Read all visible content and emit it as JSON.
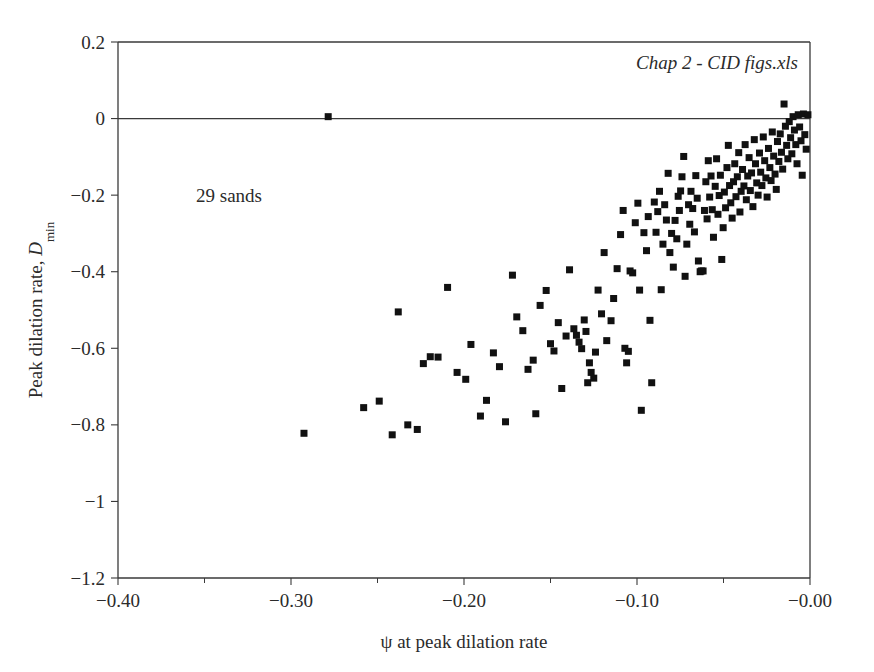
{
  "figure": {
    "background_color": "#ffffff",
    "axis_color": "#3a3a3a",
    "marker_color": "#111111",
    "annotations": {
      "sands_label": "29 sands",
      "source_label": "Chap 2 - CID figs.xls"
    }
  },
  "chart_data": {
    "type": "scatter",
    "title": "",
    "xlabel": "ψ at peak dilation rate",
    "ylabel_main": "Peak dilation rate, ",
    "ylabel_symbol": "D",
    "ylabel_subscript": "min",
    "xlim": [
      -0.4,
      0.0
    ],
    "ylim": [
      -1.2,
      0.2
    ],
    "xticks": [
      -0.4,
      -0.3,
      -0.2,
      -0.1,
      -0.0
    ],
    "xticklabels": [
      "−0.40",
      "−0.30",
      "−0.20",
      "−0.10",
      "−0.00"
    ],
    "yticks": [
      0.2,
      0,
      -0.2,
      -0.4,
      -0.6,
      -0.8,
      -1,
      -1.2
    ],
    "yticklabels": [
      "0.2",
      "0",
      "−0.2",
      "−0.4",
      "−0.6",
      "−0.8",
      "−1",
      "−1.2"
    ],
    "x_minor_ticks": [
      -0.35,
      -0.25,
      -0.15,
      -0.05
    ],
    "grid": false,
    "legend": null,
    "reference_lines": [
      {
        "axis": "y",
        "value": 0.0
      }
    ],
    "marker_style": "square",
    "marker_size_px": 7,
    "n_points": 177,
    "points": [
      [
        -0.2785,
        0.005
      ],
      [
        -0.2925,
        -0.822
      ],
      [
        -0.258,
        -0.755
      ],
      [
        -0.249,
        -0.738
      ],
      [
        -0.2415,
        -0.826
      ],
      [
        -0.238,
        -0.505
      ],
      [
        -0.2325,
        -0.8
      ],
      [
        -0.227,
        -0.812
      ],
      [
        -0.2235,
        -0.64
      ],
      [
        -0.2195,
        -0.622
      ],
      [
        -0.215,
        -0.623
      ],
      [
        -0.2095,
        -0.441
      ],
      [
        -0.204,
        -0.663
      ],
      [
        -0.199,
        -0.681
      ],
      [
        -0.196,
        -0.59
      ],
      [
        -0.1905,
        -0.777
      ],
      [
        -0.187,
        -0.736
      ],
      [
        -0.183,
        -0.612
      ],
      [
        -0.1795,
        -0.648
      ],
      [
        -0.176,
        -0.792
      ],
      [
        -0.172,
        -0.409
      ],
      [
        -0.1695,
        -0.518
      ],
      [
        -0.166,
        -0.554
      ],
      [
        -0.163,
        -0.655
      ],
      [
        -0.16,
        -0.631
      ],
      [
        -0.1585,
        -0.771
      ],
      [
        -0.156,
        -0.488
      ],
      [
        -0.1525,
        -0.449
      ],
      [
        -0.15,
        -0.588
      ],
      [
        -0.148,
        -0.607
      ],
      [
        -0.1455,
        -0.533
      ],
      [
        -0.1435,
        -0.705
      ],
      [
        -0.141,
        -0.568
      ],
      [
        -0.139,
        -0.395
      ],
      [
        -0.1365,
        -0.549
      ],
      [
        -0.135,
        -0.566
      ],
      [
        -0.1335,
        -0.584
      ],
      [
        -0.132,
        -0.601
      ],
      [
        -0.1305,
        -0.526
      ],
      [
        -0.1295,
        -0.556
      ],
      [
        -0.1285,
        -0.69
      ],
      [
        -0.1275,
        -0.638
      ],
      [
        -0.1265,
        -0.663
      ],
      [
        -0.125,
        -0.678
      ],
      [
        -0.124,
        -0.61
      ],
      [
        -0.1225,
        -0.448
      ],
      [
        -0.1205,
        -0.51
      ],
      [
        -0.119,
        -0.35
      ],
      [
        -0.1175,
        -0.58
      ],
      [
        -0.115,
        -0.528
      ],
      [
        -0.1135,
        -0.47
      ],
      [
        -0.1115,
        -0.392
      ],
      [
        -0.1095,
        -0.303
      ],
      [
        -0.108,
        -0.24
      ],
      [
        -0.107,
        -0.6
      ],
      [
        -0.106,
        -0.638
      ],
      [
        -0.105,
        -0.608
      ],
      [
        -0.104,
        -0.398
      ],
      [
        -0.1025,
        -0.403
      ],
      [
        -0.101,
        -0.272
      ],
      [
        -0.0995,
        -0.221
      ],
      [
        -0.0985,
        -0.448
      ],
      [
        -0.0975,
        -0.762
      ],
      [
        -0.096,
        -0.298
      ],
      [
        -0.0945,
        -0.345
      ],
      [
        -0.0935,
        -0.256
      ],
      [
        -0.0925,
        -0.527
      ],
      [
        -0.0915,
        -0.69
      ],
      [
        -0.09,
        -0.218
      ],
      [
        -0.089,
        -0.297
      ],
      [
        -0.088,
        -0.243
      ],
      [
        -0.087,
        -0.19
      ],
      [
        -0.086,
        -0.447
      ],
      [
        -0.085,
        -0.328
      ],
      [
        -0.084,
        -0.225
      ],
      [
        -0.083,
        -0.265
      ],
      [
        -0.082,
        -0.143
      ],
      [
        -0.081,
        -0.35
      ],
      [
        -0.08,
        -0.3
      ],
      [
        -0.079,
        -0.388
      ],
      [
        -0.078,
        -0.266
      ],
      [
        -0.077,
        -0.314
      ],
      [
        -0.0762,
        -0.203
      ],
      [
        -0.0755,
        -0.24
      ],
      [
        -0.0748,
        -0.189
      ],
      [
        -0.074,
        -0.152
      ],
      [
        -0.073,
        -0.099
      ],
      [
        -0.0722,
        -0.412
      ],
      [
        -0.0712,
        -0.328
      ],
      [
        -0.0702,
        -0.225
      ],
      [
        -0.0695,
        -0.276
      ],
      [
        -0.0688,
        -0.19
      ],
      [
        -0.0678,
        -0.235
      ],
      [
        -0.0668,
        -0.296
      ],
      [
        -0.066,
        -0.149
      ],
      [
        -0.0652,
        -0.208
      ],
      [
        -0.0645,
        -0.372
      ],
      [
        -0.0635,
        -0.4
      ],
      [
        -0.0628,
        -0.398
      ],
      [
        -0.0618,
        -0.398
      ],
      [
        -0.061,
        -0.24
      ],
      [
        -0.0602,
        -0.165
      ],
      [
        -0.0595,
        -0.262
      ],
      [
        -0.0588,
        -0.11
      ],
      [
        -0.058,
        -0.205
      ],
      [
        -0.0572,
        -0.15
      ],
      [
        -0.0565,
        -0.238
      ],
      [
        -0.0558,
        -0.31
      ],
      [
        -0.0548,
        -0.177
      ],
      [
        -0.054,
        -0.105
      ],
      [
        -0.0532,
        -0.25
      ],
      [
        -0.0525,
        -0.201
      ],
      [
        -0.0518,
        -0.148
      ],
      [
        -0.051,
        -0.368
      ],
      [
        -0.0502,
        -0.285
      ],
      [
        -0.0495,
        -0.192
      ],
      [
        -0.0488,
        -0.233
      ],
      [
        -0.048,
        -0.128
      ],
      [
        -0.0472,
        -0.07
      ],
      [
        -0.0465,
        -0.175
      ],
      [
        -0.0458,
        -0.22
      ],
      [
        -0.045,
        -0.26
      ],
      [
        -0.0442,
        -0.165
      ],
      [
        -0.0435,
        -0.118
      ],
      [
        -0.0428,
        -0.204
      ],
      [
        -0.042,
        -0.152
      ],
      [
        -0.0412,
        -0.089
      ],
      [
        -0.0405,
        -0.244
      ],
      [
        -0.0398,
        -0.19
      ],
      [
        -0.039,
        -0.133
      ],
      [
        -0.0382,
        -0.176
      ],
      [
        -0.0375,
        -0.068
      ],
      [
        -0.0368,
        -0.212
      ],
      [
        -0.036,
        -0.15
      ],
      [
        -0.0352,
        -0.102
      ],
      [
        -0.0345,
        -0.188
      ],
      [
        -0.0338,
        -0.142
      ],
      [
        -0.033,
        -0.23
      ],
      [
        -0.0322,
        -0.055
      ],
      [
        -0.0315,
        -0.118
      ],
      [
        -0.0308,
        -0.168
      ],
      [
        -0.03,
        -0.2
      ],
      [
        -0.0292,
        -0.09
      ],
      [
        -0.0285,
        -0.14
      ],
      [
        -0.0278,
        -0.175
      ],
      [
        -0.027,
        -0.048
      ],
      [
        -0.0262,
        -0.11
      ],
      [
        -0.0255,
        -0.155
      ],
      [
        -0.0248,
        -0.205
      ],
      [
        -0.024,
        -0.078
      ],
      [
        -0.0232,
        -0.128
      ],
      [
        -0.0225,
        -0.162
      ],
      [
        -0.0218,
        -0.035
      ],
      [
        -0.021,
        -0.098
      ],
      [
        -0.0202,
        -0.145
      ],
      [
        -0.0195,
        -0.185
      ],
      [
        -0.0188,
        -0.06
      ],
      [
        -0.018,
        -0.112
      ],
      [
        -0.0172,
        -0.04
      ],
      [
        -0.0165,
        -0.088
      ],
      [
        -0.0158,
        -0.132
      ],
      [
        -0.015,
        0.038
      ],
      [
        -0.0142,
        -0.02
      ],
      [
        -0.0135,
        -0.07
      ],
      [
        -0.0128,
        -0.105
      ],
      [
        -0.012,
        -0.008
      ],
      [
        -0.0112,
        -0.05
      ],
      [
        -0.0105,
        -0.092
      ],
      [
        -0.0098,
        0.005
      ],
      [
        -0.009,
        -0.03
      ],
      [
        -0.0082,
        -0.068
      ],
      [
        -0.0075,
        -0.118
      ],
      [
        -0.0068,
        0.01
      ],
      [
        -0.006,
        -0.022
      ],
      [
        -0.0052,
        -0.058
      ],
      [
        -0.0045,
        -0.148
      ],
      [
        -0.0038,
        0.012
      ],
      [
        -0.003,
        -0.042
      ],
      [
        -0.0022,
        -0.08
      ],
      [
        -0.0012,
        0.01
      ]
    ]
  }
}
